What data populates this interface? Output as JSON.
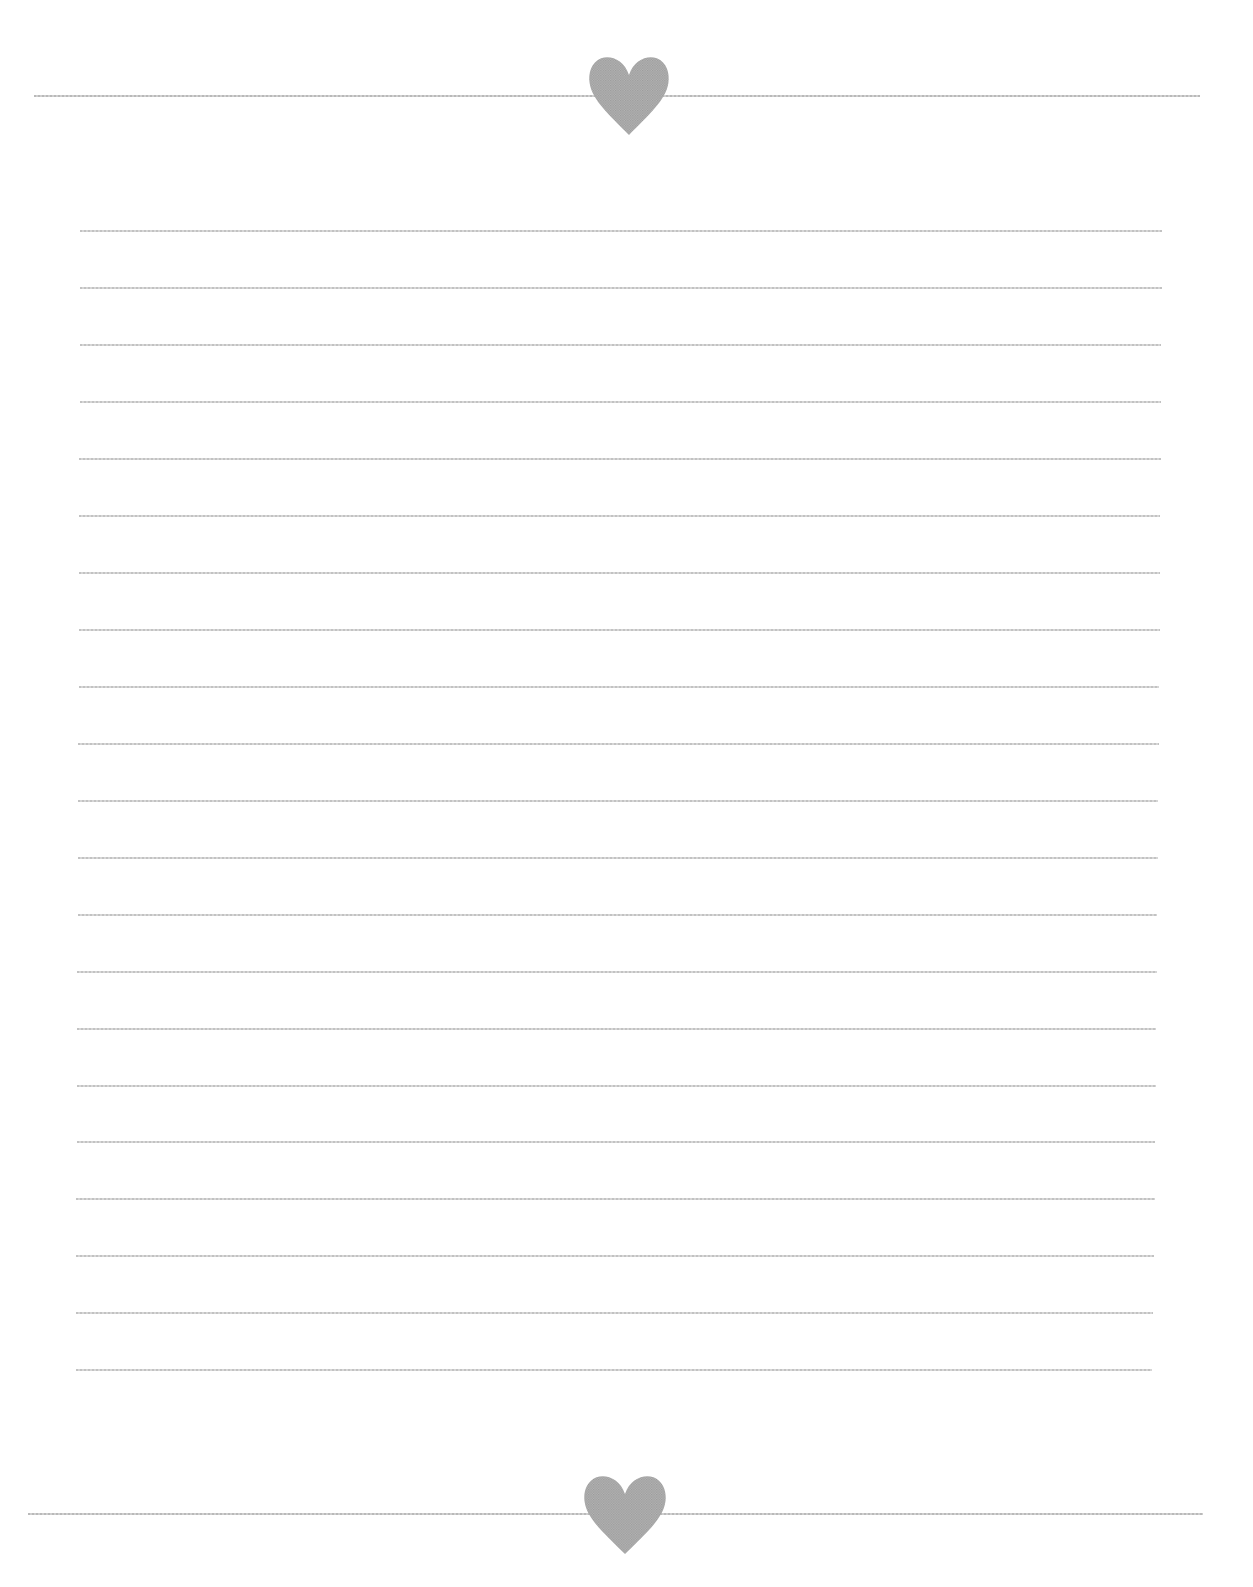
{
  "document": {
    "type": "lined-stationery",
    "background_color": "#ffffff",
    "line_color": "#c4c4c4",
    "ornament_color": "#a8a8a8"
  },
  "header": {
    "ornament": "heart-icon",
    "divider": {
      "x1": 34,
      "x2": 1200,
      "y": 96
    },
    "heart": {
      "cx": 629,
      "top": 55,
      "width": 82,
      "height": 80
    }
  },
  "footer": {
    "ornament": "heart-icon",
    "divider": {
      "x1": 28,
      "x2": 1203,
      "y": 1514
    },
    "heart": {
      "cx": 625,
      "top": 1474,
      "width": 84,
      "height": 80
    }
  },
  "writing_area": {
    "line_count": 21,
    "lines": [
      {
        "y": 231,
        "x1": 80,
        "x2": 1162
      },
      {
        "y": 288,
        "x1": 80,
        "x2": 1162
      },
      {
        "y": 345,
        "x1": 80,
        "x2": 1161
      },
      {
        "y": 402,
        "x1": 80,
        "x2": 1161
      },
      {
        "y": 459,
        "x1": 79,
        "x2": 1161
      },
      {
        "y": 516,
        "x1": 79,
        "x2": 1160
      },
      {
        "y": 573,
        "x1": 79,
        "x2": 1160
      },
      {
        "y": 630,
        "x1": 79,
        "x2": 1160
      },
      {
        "y": 687,
        "x1": 79,
        "x2": 1159
      },
      {
        "y": 744,
        "x1": 78,
        "x2": 1159
      },
      {
        "y": 801,
        "x1": 78,
        "x2": 1158
      },
      {
        "y": 858,
        "x1": 78,
        "x2": 1158
      },
      {
        "y": 915,
        "x1": 78,
        "x2": 1157
      },
      {
        "y": 972,
        "x1": 77,
        "x2": 1157
      },
      {
        "y": 1029,
        "x1": 77,
        "x2": 1156
      },
      {
        "y": 1086,
        "x1": 77,
        "x2": 1156
      },
      {
        "y": 1142,
        "x1": 77,
        "x2": 1155
      },
      {
        "y": 1199,
        "x1": 76,
        "x2": 1155
      },
      {
        "y": 1256,
        "x1": 76,
        "x2": 1154
      },
      {
        "y": 1313,
        "x1": 76,
        "x2": 1153
      },
      {
        "y": 1370,
        "x1": 76,
        "x2": 1152
      }
    ]
  }
}
